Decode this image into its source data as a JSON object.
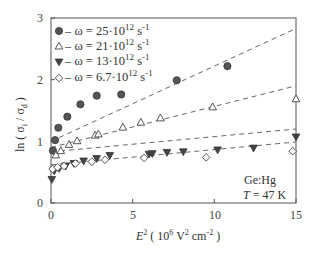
{
  "chart_data": {
    "type": "scatter",
    "title": "",
    "xlabel": "E² ( 10⁶ V² cm⁻² )",
    "ylabel": "ln ( σi / σd )",
    "xlim": [
      0,
      15
    ],
    "ylim": [
      0,
      3
    ],
    "xticks": [
      0,
      5,
      10,
      15
    ],
    "yticks": [
      0,
      1,
      2,
      3
    ],
    "grid": false,
    "legend_position": "upper-left",
    "annotations": [
      "Ge:Hg",
      "T = 47 K"
    ],
    "series": [
      {
        "name": "ω = 25·10¹² s⁻¹",
        "marker": "filled-circle",
        "color": "#555555",
        "x": [
          0.12,
          0.25,
          0.45,
          1.0,
          1.8,
          2.8,
          4.3,
          7.7,
          10.8
        ],
        "y": [
          0.85,
          1.02,
          1.22,
          1.4,
          1.6,
          1.74,
          1.76,
          1.99,
          2.22
        ],
        "fit_line": {
          "x": [
            0,
            15
          ],
          "y": [
            1.0,
            2.83
          ]
        }
      },
      {
        "name": "ω = 21·10¹² s⁻¹",
        "marker": "open-triangle",
        "color": "#555555",
        "x": [
          0.3,
          0.6,
          1.1,
          1.6,
          2.7,
          2.9,
          4.4,
          5.5,
          6.7,
          9.9,
          15.0
        ],
        "y": [
          0.78,
          0.85,
          0.95,
          1.01,
          1.1,
          1.12,
          1.23,
          1.31,
          1.38,
          1.56,
          1.69
        ],
        "fit_line": {
          "x": [
            0,
            15
          ],
          "y": [
            0.9,
            1.9
          ]
        }
      },
      {
        "name": "ω = 13·10¹² s⁻¹",
        "marker": "filled-triangle-down",
        "color": "#444444",
        "x": [
          0.05,
          0.2,
          0.5,
          0.9,
          1.4,
          2.0,
          2.8,
          3.6,
          6.0,
          6.2,
          7.1,
          8.1,
          10.2,
          12.4,
          15.0
        ],
        "y": [
          0.38,
          0.52,
          0.56,
          0.6,
          0.64,
          0.68,
          0.72,
          0.77,
          0.79,
          0.8,
          0.82,
          0.83,
          0.86,
          0.89,
          1.07
        ],
        "fit_line": {
          "x": [
            0,
            15
          ],
          "y": [
            0.83,
            1.2
          ]
        }
      },
      {
        "name": "ω = 6.7·10¹² s⁻¹",
        "marker": "open-diamond",
        "color": "#555555",
        "x": [
          0.1,
          0.4,
          0.8,
          1.5,
          2.5,
          3.3,
          5.7,
          9.5,
          14.8
        ],
        "y": [
          0.55,
          0.58,
          0.6,
          0.64,
          0.67,
          0.7,
          0.73,
          0.74,
          0.84
        ],
        "fit_line": {
          "x": [
            0,
            15
          ],
          "y": [
            0.62,
            0.99
          ]
        }
      }
    ]
  },
  "legend": {
    "items": [
      {
        "label": "– ω = 25·10",
        "exp": "12",
        "unit": " s",
        "unit_exp": "-1"
      },
      {
        "label": "– ω = 21·10",
        "exp": "12",
        "unit": " s",
        "unit_exp": "-1"
      },
      {
        "label": "– ω = 13·10",
        "exp": "12",
        "unit": " s",
        "unit_exp": "-1"
      },
      {
        "label": "– ω = 6.7·10",
        "exp": "12",
        "unit": " s",
        "unit_exp": "-1"
      }
    ]
  },
  "axes": {
    "x_label_main": "E",
    "x_label_sup": "2",
    "x_label_rest": " ( 10",
    "x_label_sup2": "6",
    "x_label_rest2": "  V",
    "x_label_sup3": "2",
    "x_label_rest3": " cm",
    "x_label_sup4": "-2",
    "x_label_end": " )",
    "y_label_prefix": "ln ( σ",
    "y_label_sub1": "i",
    "y_label_mid": " / σ",
    "y_label_sub2": "d",
    "y_label_end": " )",
    "x_ticks": [
      "0",
      "5",
      "10",
      "15"
    ],
    "y_ticks": [
      "0",
      "1",
      "2",
      "3"
    ]
  },
  "annotation": {
    "material": "Ge:Hg",
    "temp_var": "T",
    "temp_rest": " = 47 K"
  }
}
